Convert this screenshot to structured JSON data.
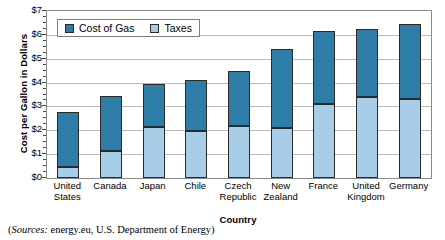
{
  "chart_data": {
    "type": "bar",
    "subtype": "stacked-vertical",
    "title": "",
    "xlabel": "Country",
    "ylabel": "Cost per Gallon in Dollars",
    "ylim": [
      0,
      7
    ],
    "ytick_step": 1,
    "ytick_labels": [
      "$0",
      "$1",
      "$2",
      "$3",
      "$4",
      "$5",
      "$6",
      "$7"
    ],
    "ytick_values": [
      0,
      1,
      2,
      3,
      4,
      5,
      6,
      7
    ],
    "minor_ticks": true,
    "grid": "horizontal",
    "legend_position": "top-left-inside",
    "categories": [
      "United States",
      "Canada",
      "Japan",
      "Chile",
      "Czech Republic",
      "New Zealand",
      "France",
      "United Kingdom",
      "Germany"
    ],
    "category_lines": [
      [
        "United",
        "States"
      ],
      [
        "Canada",
        ""
      ],
      [
        "Japan",
        ""
      ],
      [
        "Chile",
        ""
      ],
      [
        "Czech",
        "Republic"
      ],
      [
        "New",
        "Zealand"
      ],
      [
        "France",
        ""
      ],
      [
        "United",
        "Kingdom"
      ],
      [
        "Germany",
        ""
      ]
    ],
    "series": [
      {
        "name": "Taxes",
        "color": "#a8cde8",
        "values": [
          0.45,
          1.15,
          2.15,
          1.95,
          2.2,
          2.1,
          3.1,
          3.4,
          3.3
        ]
      },
      {
        "name": "Cost of Gas",
        "color": "#2e7ca8",
        "values": [
          2.3,
          2.3,
          1.8,
          2.15,
          2.3,
          3.3,
          3.05,
          2.85,
          3.15
        ]
      }
    ],
    "totals": [
      2.75,
      3.45,
      3.95,
      4.1,
      4.5,
      5.4,
      6.15,
      6.25,
      6.45
    ]
  },
  "legend": {
    "entries": [
      {
        "label": "Cost of Gas",
        "color": "#2e7ca8"
      },
      {
        "label": "Taxes",
        "color": "#a8cde8"
      }
    ]
  },
  "source": {
    "prefix": "(",
    "emphasis": "Sources:",
    "text": " energy.eu, U.S. Department of Energy)"
  },
  "colors": {
    "cost_of_gas": "#2e7ca8",
    "taxes": "#a8cde8",
    "grid": "#b9b9b9",
    "axis": "#8a8a8a",
    "bar_outline": "#2a2a2a"
  }
}
